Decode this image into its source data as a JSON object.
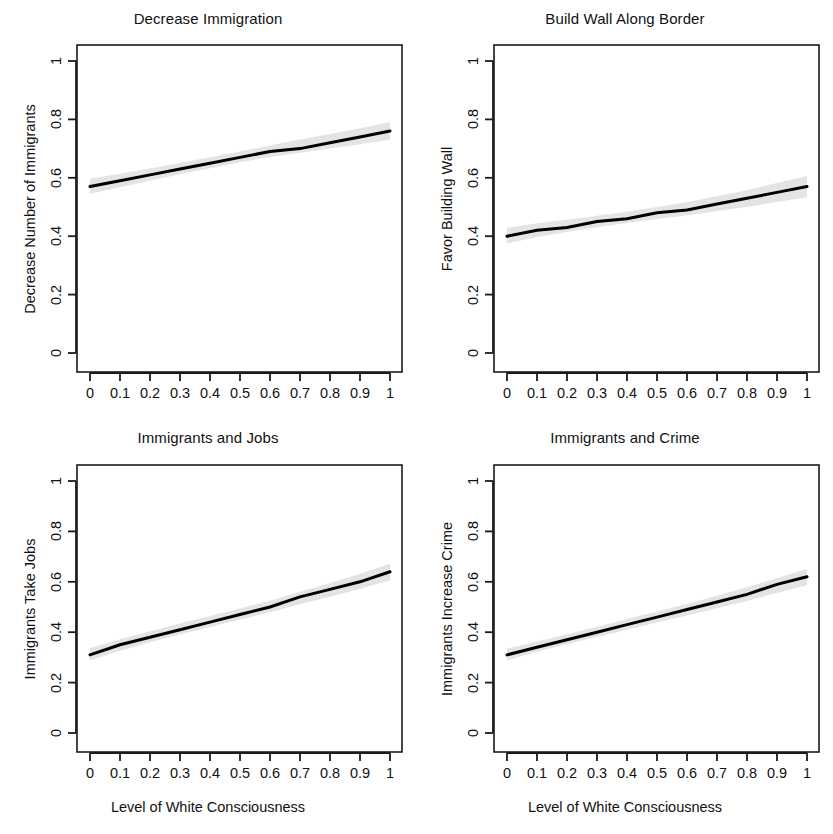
{
  "figure": {
    "background": "#ffffff",
    "line_color": "#000000",
    "band_color": "#d9d9d9",
    "axis_color": "#1a1a1a"
  },
  "shared": {
    "xlabel": "Level of White Consciousness",
    "xticks": [
      "0",
      "0.1",
      "0.2",
      "0.3",
      "0.4",
      "0.5",
      "0.6",
      "0.7",
      "0.8",
      "0.9",
      "1"
    ],
    "yticks": [
      "0",
      "0.2",
      "0.4",
      "0.6",
      "0.8",
      "1"
    ]
  },
  "chart_data": [
    {
      "type": "line",
      "title": "Decrease Immigration",
      "xlabel": "",
      "ylabel": "Decrease Number of Immigrants",
      "xlim": [
        0,
        1
      ],
      "ylim": [
        0,
        1.05
      ],
      "grid": false,
      "legend": "none",
      "x": [
        0,
        0.1,
        0.2,
        0.3,
        0.4,
        0.5,
        0.6,
        0.7,
        0.8,
        0.9,
        1
      ],
      "values": [
        0.57,
        0.59,
        0.61,
        0.63,
        0.65,
        0.67,
        0.69,
        0.7,
        0.72,
        0.74,
        0.76
      ],
      "ci_lower": [
        0.545,
        0.568,
        0.59,
        0.612,
        0.633,
        0.653,
        0.671,
        0.686,
        0.7,
        0.715,
        0.73
      ],
      "ci_upper": [
        0.598,
        0.614,
        0.632,
        0.651,
        0.67,
        0.69,
        0.711,
        0.731,
        0.75,
        0.77,
        0.791
      ],
      "annotations": []
    },
    {
      "type": "line",
      "title": "Build Wall Along Border",
      "xlabel": "",
      "ylabel": "Favor Building Wall",
      "xlim": [
        0,
        1
      ],
      "ylim": [
        0,
        1.05
      ],
      "grid": false,
      "legend": "none",
      "x": [
        0,
        0.1,
        0.2,
        0.3,
        0.4,
        0.5,
        0.6,
        0.7,
        0.8,
        0.9,
        1
      ],
      "values": [
        0.4,
        0.42,
        0.43,
        0.45,
        0.46,
        0.48,
        0.49,
        0.51,
        0.53,
        0.55,
        0.57
      ],
      "ci_lower": [
        0.375,
        0.397,
        0.414,
        0.431,
        0.445,
        0.459,
        0.471,
        0.486,
        0.5,
        0.517,
        0.533
      ],
      "ci_upper": [
        0.428,
        0.444,
        0.456,
        0.47,
        0.484,
        0.5,
        0.517,
        0.537,
        0.558,
        0.582,
        0.606
      ],
      "annotations": []
    },
    {
      "type": "line",
      "title": "Immigrants and Jobs",
      "xlabel": "Level of White Consciousness",
      "ylabel": "Immigrants Take Jobs",
      "xlim": [
        0,
        1
      ],
      "ylim": [
        0,
        1.05
      ],
      "grid": false,
      "legend": "none",
      "x": [
        0,
        0.1,
        0.2,
        0.3,
        0.4,
        0.5,
        0.6,
        0.7,
        0.8,
        0.9,
        1
      ],
      "values": [
        0.31,
        0.35,
        0.38,
        0.41,
        0.44,
        0.47,
        0.5,
        0.54,
        0.57,
        0.6,
        0.64
      ],
      "ci_lower": [
        0.288,
        0.326,
        0.36,
        0.391,
        0.421,
        0.45,
        0.479,
        0.511,
        0.541,
        0.572,
        0.605
      ],
      "ci_upper": [
        0.336,
        0.372,
        0.404,
        0.435,
        0.464,
        0.494,
        0.525,
        0.561,
        0.595,
        0.632,
        0.672
      ],
      "annotations": []
    },
    {
      "type": "line",
      "title": "Immigrants and Crime",
      "xlabel": "Level of White Consciousness",
      "ylabel": "Immigrants Increase Crime",
      "xlim": [
        0,
        1
      ],
      "ylim": [
        0,
        1.05
      ],
      "grid": false,
      "legend": "none",
      "x": [
        0,
        0.1,
        0.2,
        0.3,
        0.4,
        0.5,
        0.6,
        0.7,
        0.8,
        0.9,
        1
      ],
      "values": [
        0.31,
        0.34,
        0.37,
        0.4,
        0.43,
        0.46,
        0.49,
        0.52,
        0.55,
        0.59,
        0.62
      ],
      "ci_lower": [
        0.289,
        0.322,
        0.352,
        0.381,
        0.41,
        0.438,
        0.466,
        0.495,
        0.524,
        0.556,
        0.586
      ],
      "ci_upper": [
        0.334,
        0.363,
        0.392,
        0.422,
        0.452,
        0.482,
        0.512,
        0.545,
        0.578,
        0.615,
        0.651
      ],
      "annotations": []
    }
  ]
}
